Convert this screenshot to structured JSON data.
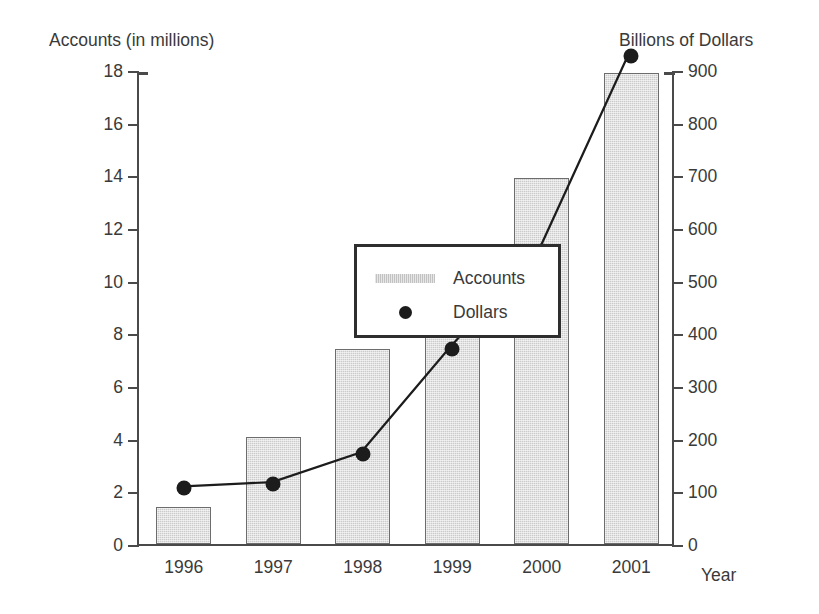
{
  "chart_data": {
    "type": "bar",
    "title": "",
    "categories": [
      "1996",
      "1997",
      "1998",
      "1999",
      "2000",
      "2001"
    ],
    "xlabel": "Year",
    "grid": false,
    "legend_position": "inside-upper-left",
    "series": [
      {
        "name": "Accounts",
        "type": "bar",
        "axis": "left",
        "ylabel": "Accounts (in millions)",
        "ylim": [
          0,
          18
        ],
        "ytick_step": 2,
        "yticks": [
          "0",
          "2",
          "4",
          "6",
          "8",
          "10",
          "12",
          "14",
          "16",
          "18"
        ],
        "values": [
          1.4,
          4.05,
          7.4,
          10.4,
          13.9,
          17.9
        ],
        "color": "#cbcbcb"
      },
      {
        "name": "Dollars",
        "type": "line",
        "axis": "right",
        "ylabel": "Billions of Dollars",
        "ylim": [
          0,
          900
        ],
        "ytick_step": 100,
        "yticks": [
          "0",
          "100",
          "200",
          "300",
          "400",
          "500",
          "600",
          "700",
          "800",
          "900"
        ],
        "values": [
          110,
          118,
          175,
          375,
          560,
          930
        ],
        "color": "#1c1c1c"
      }
    ]
  },
  "axes": {
    "left_title": "Accounts (in millions)",
    "right_title": "Billions of Dollars",
    "x_title": "Year"
  },
  "legend": {
    "items": [
      {
        "label": "Accounts",
        "marker": "swatch"
      },
      {
        "label": "Dollars",
        "marker": "dot"
      }
    ]
  }
}
